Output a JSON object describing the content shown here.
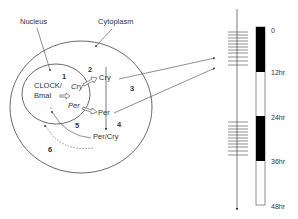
{
  "labels": {
    "nucleus": "Nucleus",
    "cytoplasm": "Cytoplasm",
    "clock_line1": "CLOCK/",
    "clock_line2": "Bmal",
    "cry_nuclear": "Cry",
    "per_nuclear": "Per",
    "cry_cyto": "Cry",
    "per_cyto": "Per",
    "per_cry": "Per/Cry"
  },
  "steps": [
    "1",
    "2",
    "3",
    "4",
    "5",
    "6"
  ],
  "timeline": {
    "ticks": [
      "0",
      "12hr",
      "24hr",
      "36hr",
      "48hr"
    ],
    "dark_periods": [
      [
        "0",
        "12hr"
      ],
      [
        "24hr",
        "36hr"
      ]
    ],
    "colors": {
      "dark": "#000000",
      "light": "#ffffff",
      "line": "#333333"
    }
  }
}
